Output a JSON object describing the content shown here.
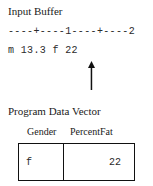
{
  "input_buffer": {
    "heading": "Input Buffer",
    "ruler": "----+----1----+----2",
    "content": "m 13.3 f 22",
    "pointer_icon": "up-arrow-icon"
  },
  "program_data_vector": {
    "heading": "Program Data Vector",
    "columns": [
      "Gender",
      "PercentFat"
    ],
    "row": {
      "gender": "f",
      "percentfat": "22"
    }
  },
  "colors": {
    "text": "#1a1a1a",
    "mono_text": "#2b2b2b",
    "border": "#111111",
    "background": "#ffffff"
  }
}
